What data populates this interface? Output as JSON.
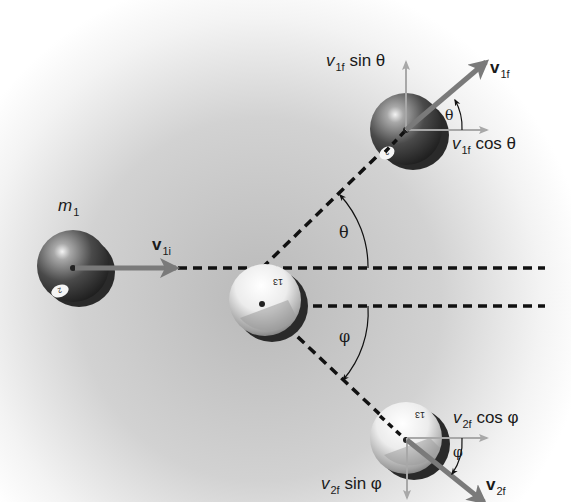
{
  "figure": {
    "colors": {
      "background_center": "#b8b8b8",
      "background_edge": "#ffffff",
      "vector": "#7a7a7a",
      "component": "#a8a8a8",
      "dashed_line": "#111111",
      "ball_dark": "#3a3a3a",
      "ball_light": "#f2f2f2"
    }
  },
  "labels": {
    "mass1": {
      "base": "m",
      "sub": "1"
    },
    "v1i": {
      "base": "v",
      "sub": "1i"
    },
    "v1f": {
      "base": "v",
      "sub": "1f"
    },
    "v2f": {
      "base": "v",
      "sub": "2f"
    },
    "v1f_sin": {
      "base": "v",
      "sub": "1f",
      "rest": " sin θ"
    },
    "v1f_cos": {
      "base": "v",
      "sub": "1f",
      "rest": " cos θ"
    },
    "v2f_cos": {
      "base": "v",
      "sub": "2f",
      "rest": " cos φ"
    },
    "v2f_sin": {
      "base": "v",
      "sub": "2f",
      "rest": " sin φ"
    },
    "theta_main": "θ",
    "phi_main": "φ",
    "theta_small": "θ",
    "phi_small": "φ"
  },
  "balls": [
    {
      "id": "ball-1-initial",
      "number": "2",
      "style": "dark"
    },
    {
      "id": "ball-2-initial",
      "number": "13",
      "style": "light"
    },
    {
      "id": "ball-1-final",
      "number": "2",
      "style": "dark"
    },
    {
      "id": "ball-2-final",
      "number": "13",
      "style": "light"
    }
  ]
}
